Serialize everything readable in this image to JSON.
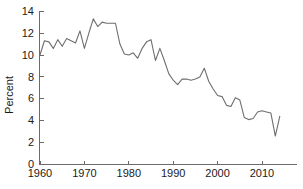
{
  "chart_data": {
    "type": "line",
    "title": "",
    "subtitle": "",
    "xlabel": "",
    "ylabel": "Percent",
    "xlim": [
      1959.0,
      2015.5
    ],
    "ylim": [
      0,
      14
    ],
    "grid": false,
    "legend": null,
    "annotations": [],
    "x_ticks": [
      1960,
      1970,
      1980,
      1990,
      2000,
      2010
    ],
    "x_tick_labels": [
      "1960",
      "1970",
      "1980",
      "1990",
      "2000",
      "2010"
    ],
    "y_ticks": [
      0,
      2,
      4,
      6,
      8,
      10,
      12,
      14
    ],
    "y_tick_labels": [
      "0",
      "2",
      "4",
      "6",
      "8",
      "10",
      "12",
      "14"
    ],
    "line_color": "#6e6e6e",
    "axis_color": "#6b6b6b",
    "series": [
      {
        "name": "Percent",
        "x": [
          1960,
          1961,
          1962,
          1963,
          1964,
          1965,
          1966,
          1967,
          1968,
          1969,
          1970,
          1971,
          1972,
          1973,
          1974,
          1975,
          1976,
          1977,
          1978,
          1979,
          1980,
          1981,
          1982,
          1983,
          1984,
          1985,
          1986,
          1987,
          1988,
          1989,
          1990,
          1991,
          1992,
          1993,
          1994,
          1995,
          1996,
          1997,
          1998,
          1999,
          2000,
          2001,
          2002,
          2003,
          2004,
          2005,
          2006,
          2007,
          2008,
          2009,
          2010,
          2011,
          2012,
          2013,
          2014
        ],
        "values": [
          10.0,
          11.3,
          11.2,
          10.6,
          11.4,
          10.8,
          11.5,
          11.3,
          11.1,
          12.2,
          10.6,
          12.0,
          13.3,
          12.6,
          13.0,
          12.9,
          12.9,
          12.9,
          11.0,
          10.1,
          10.0,
          10.2,
          9.7,
          10.6,
          11.2,
          11.4,
          9.5,
          10.6,
          9.5,
          8.3,
          7.7,
          7.3,
          7.8,
          7.8,
          7.7,
          7.8,
          8.0,
          8.8,
          7.6,
          6.9,
          6.3,
          6.2,
          5.4,
          5.3,
          6.1,
          5.9,
          4.3,
          4.1,
          4.2,
          4.8,
          4.9,
          4.8,
          4.7,
          2.6,
          4.4
        ],
        "values_continued_note": ""
      }
    ],
    "series_detail_points": {
      "start_year": 1960,
      "start_value": 10.0,
      "peak_year": 1972,
      "peak_value": 13.3,
      "min_year": 2006,
      "min_value": 2.6,
      "late_peak_year": 2013,
      "late_peak_value": 7.4,
      "end_year": 2014,
      "end_value": 4.7
    }
  },
  "axes": {
    "ylabel": "Percent"
  }
}
